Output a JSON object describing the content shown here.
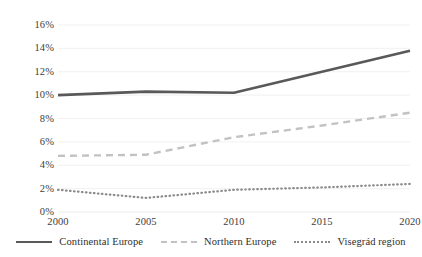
{
  "chart_data": {
    "type": "line",
    "title": "",
    "subtitle": "",
    "xlabel": "",
    "ylabel": "",
    "categories": [
      "2000",
      "2005",
      "2010",
      "2015",
      "2020"
    ],
    "x": [
      2000,
      2005,
      2010,
      2015,
      2020
    ],
    "xlim": [
      2000,
      2020
    ],
    "ylim": [
      0,
      16
    ],
    "ytick_labels": [
      "0%",
      "2%",
      "4%",
      "6%",
      "8%",
      "10%",
      "12%",
      "14%",
      "16%"
    ],
    "ytick_values": [
      0,
      2,
      4,
      6,
      8,
      10,
      12,
      14,
      16
    ],
    "xtick_labels": [
      "2000",
      "2005",
      "2010",
      "2015",
      "2020"
    ],
    "grid": true,
    "grid_axis": "y",
    "legend_position": "bottom",
    "series": [
      {
        "name": "Continental Europe",
        "style": "solid",
        "color": "#595959",
        "values": [
          10.0,
          10.3,
          10.2,
          12.0,
          13.8
        ]
      },
      {
        "name": "Northern Europe",
        "style": "dashed",
        "color": "#c2c2c2",
        "values": [
          4.8,
          4.9,
          6.4,
          7.4,
          8.5
        ]
      },
      {
        "name": "Visegrád region",
        "style": "dotted",
        "color": "#8a8a8a",
        "values": [
          1.9,
          1.2,
          1.9,
          2.1,
          2.4
        ]
      }
    ]
  },
  "axes": {
    "y_ticks": [
      {
        "label": "16%",
        "value": 16
      },
      {
        "label": "14%",
        "value": 14
      },
      {
        "label": "12%",
        "value": 12
      },
      {
        "label": "10%",
        "value": 10
      },
      {
        "label": "8%",
        "value": 8
      },
      {
        "label": "6%",
        "value": 6
      },
      {
        "label": "4%",
        "value": 4
      },
      {
        "label": "2%",
        "value": 2
      },
      {
        "label": "0%",
        "value": 0
      }
    ],
    "x_ticks": [
      {
        "label": "2000",
        "value": 2000
      },
      {
        "label": "2005",
        "value": 2005
      },
      {
        "label": "2010",
        "value": 2010
      },
      {
        "label": "2015",
        "value": 2015
      },
      {
        "label": "2020",
        "value": 2020
      }
    ]
  },
  "legend": {
    "items": [
      {
        "label": "Continental Europe",
        "style": "solid",
        "color": "#595959"
      },
      {
        "label": "Northern Europe",
        "style": "dashed",
        "color": "#c2c2c2"
      },
      {
        "label": "Visegrád region",
        "style": "dotted",
        "color": "#8a8a8a"
      }
    ]
  },
  "colors": {
    "background": "#ffffff",
    "gridline": "#ededed",
    "text": "#404040"
  }
}
